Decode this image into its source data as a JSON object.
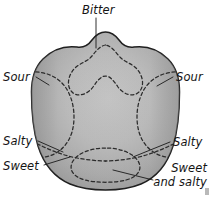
{
  "figure": {
    "background_color": "#ffffff",
    "outline_color": "#1c1c1c",
    "region_line_color": "#2b2b2b",
    "leader_line_color": "#1a1a1a",
    "label_color": "#141414",
    "tongue_fill_light": "#c2c2c2",
    "tongue_fill_mid": "#b0b0b0",
    "tongue_fill_dark": "#9a9a9a"
  },
  "labels": {
    "bitter": "Bitter",
    "sour_left": "Sour",
    "sour_right": "Sour",
    "salty_left": "Salty",
    "salty_right": "Salty",
    "sweet_left": "Sweet",
    "sweet_right_line1": "Sweet",
    "sweet_right_line2": "and salty"
  },
  "regions": [
    {
      "name": "bitter-region",
      "taste": "Bitter",
      "location": "posterior (back) of tongue"
    },
    {
      "name": "sour-region-left",
      "taste": "Sour",
      "location": "left lateral margin"
    },
    {
      "name": "sour-region-right",
      "taste": "Sour",
      "location": "right lateral margin"
    },
    {
      "name": "salty-region-left",
      "taste": "Salty",
      "location": "left anterolateral edge"
    },
    {
      "name": "salty-region-right",
      "taste": "Salty",
      "location": "right anterolateral edge"
    },
    {
      "name": "sweet-region",
      "taste": "Sweet",
      "location": "apex (tip) of tongue"
    },
    {
      "name": "sweet-and-salty-region",
      "taste": "Sweet and salty",
      "location": "anterior tip, overlapping zone"
    }
  ]
}
